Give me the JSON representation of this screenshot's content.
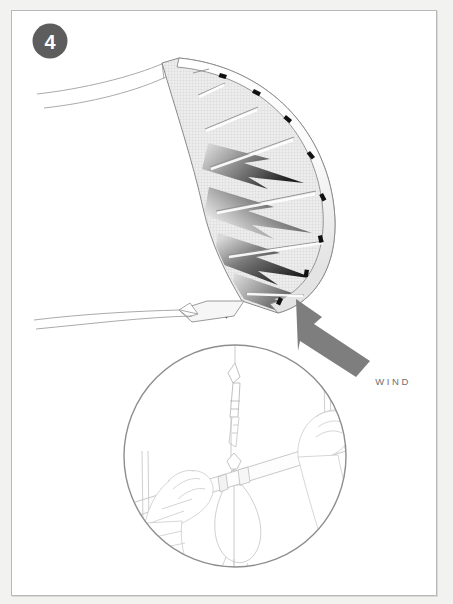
{
  "page": {
    "background_color": "#f2f2f1",
    "panel_color": "#ffffff",
    "border_color": "#b9b9b9",
    "width": 453,
    "height": 604
  },
  "step": {
    "number": "4",
    "badge_fill": "#5d5d5d",
    "badge_text_color": "#ffffff"
  },
  "wind": {
    "label": "WIND",
    "arrow_color": "#7e7e7e",
    "label_color": "#6f6f6f",
    "direction": "up-left"
  },
  "kite": {
    "name": "inflatable-leading-edge-kite",
    "outline_color": "#8c8c8c",
    "canopy_fill": "#ececec",
    "canopy_texture": "cross-hatch-grid",
    "bolt_dark": "#2b2b2b",
    "bolt_light": "#d8d8d8",
    "strut_count": 7,
    "valve_tab_color": "#111111",
    "valve_tab_count": 9,
    "line_color": "#9a9a9a"
  },
  "inset": {
    "name": "control-bar-detail",
    "shape": "circle",
    "center_x": 234,
    "center_y": 455,
    "radius": 112,
    "border_color": "#8e8e8e",
    "line_color": "#c9c9c9",
    "contents": [
      "flying-line",
      "larks-head-knot",
      "leader-loop",
      "control-bar",
      "left-hand-grip",
      "right-hand-grip",
      "safety-leash"
    ]
  }
}
